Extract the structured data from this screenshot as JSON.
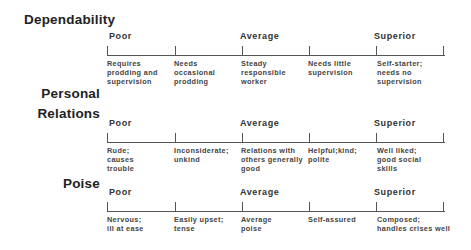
{
  "scales": [
    {
      "title_lines": [
        "Dependability"
      ],
      "anchors": {
        "poor": "Poor",
        "average": "Average",
        "superior": "Superior"
      },
      "descriptors": [
        "Requires\nprodding and\nsupervision",
        "Needs\noccasional\nprodding",
        "Steady\nresponsible\nworker",
        "Needs little\nsupervision",
        "Self-starter;\nneeds no\nsupervision"
      ]
    },
    {
      "title_lines": [
        "Personal",
        "Relations"
      ],
      "anchors": {
        "poor": "Poor",
        "average": "Average",
        "superior": "Superior"
      },
      "descriptors": [
        "Rude;\ncauses\ntrouble",
        "Inconsiderate;\nunkind",
        "Relations with\nothers generally\ngood",
        "Helpful;kind;\npolite",
        "Well liked;\ngood social\nskills"
      ]
    },
    {
      "title_lines": [
        "Poise"
      ],
      "anchors": {
        "poor": "Poor",
        "average": "Average",
        "superior": "Superior"
      },
      "descriptors": [
        "Nervous;\nill at ease",
        "Easily upset;\ntense",
        "Average\npoise",
        "Self-assured",
        "Composed;\nhandles crises well"
      ]
    }
  ]
}
